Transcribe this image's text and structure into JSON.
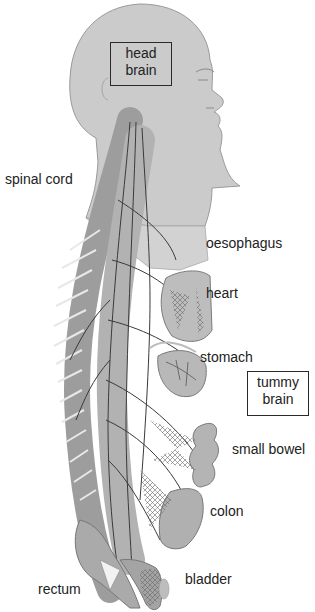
{
  "figure": {
    "colors": {
      "background": "#ffffff",
      "skin": "#c9c9c9",
      "skin_edge": "#9a9a9a",
      "organ": "#a9a9a9",
      "organ_dark": "#6e6e6e",
      "nerve": "#3a3a3a",
      "text": "#222222"
    }
  },
  "boxed_labels": {
    "head_brain": {
      "line1": "head",
      "line2": "brain"
    },
    "tummy_brain": {
      "line1": "tummy",
      "line2": "brain"
    }
  },
  "labels": {
    "spinal_cord": "spinal cord",
    "oesophagus": "oesophagus",
    "heart": "heart",
    "stomach": "stomach",
    "small_bowel": "small bowel",
    "colon": "colon",
    "rectum": "rectum",
    "bladder": "bladder"
  }
}
